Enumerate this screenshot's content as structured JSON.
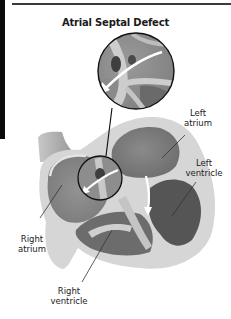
{
  "title": "Atrial Septal Defect",
  "labels": {
    "left_atrium": {
      "line1": "Left",
      "line2": "atrium"
    },
    "left_ventricle": {
      "line1": "Left",
      "line2": "ventricle"
    },
    "right_atrium": {
      "line1": "Right",
      "line2": "atrium"
    },
    "right_ventricle": {
      "line1": "Right",
      "line2": "ventricle"
    }
  },
  "colors": {
    "accent_bar": "#0a0a0a",
    "outer_wall": "#d6d6d6",
    "chamber_mid": "#8c8c8c",
    "chamber_dark": "#555555",
    "septum": "#c4c4c4",
    "arrow": "#ffffff"
  }
}
